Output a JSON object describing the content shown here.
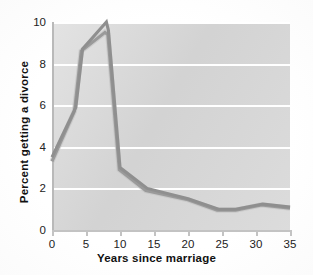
{
  "chart_data": {
    "type": "line",
    "title": "",
    "xlabel": "Years since marriage",
    "ylabel": "Percent getting a divorce",
    "xlim": [
      0,
      35
    ],
    "ylim": [
      0,
      10
    ],
    "xticks": [
      0,
      5,
      10,
      15,
      20,
      25,
      30,
      35
    ],
    "yticks": [
      0,
      2,
      4,
      6,
      8,
      10
    ],
    "grid": "horizontal",
    "legend": "none",
    "series": [
      {
        "name": "series-1",
        "color": "#8f8f8f",
        "x": [
          0,
          3.5,
          4.5,
          8,
          8.3,
          10,
          14,
          20,
          24.5,
          27,
          31,
          35
        ],
        "y": [
          3.5,
          5.9,
          8.7,
          10.0,
          9.6,
          3.0,
          2.0,
          1.5,
          1.0,
          1.0,
          1.25,
          1.1
        ]
      },
      {
        "name": "series-2",
        "color": "#9a9a9a",
        "x": [
          0,
          3.3,
          4.3,
          7.8,
          8.2,
          9.9,
          13.8,
          20,
          24.3,
          27,
          30.8,
          35
        ],
        "y": [
          3.3,
          5.7,
          8.6,
          9.5,
          9.4,
          2.9,
          1.9,
          1.45,
          0.95,
          0.95,
          1.2,
          1.05
        ]
      }
    ]
  },
  "axes": {
    "y_tick_labels": [
      "10",
      "8",
      "6",
      "4",
      "2",
      "0"
    ],
    "x_tick_labels": [
      "0",
      "5",
      "10",
      "15",
      "20",
      "25",
      "30",
      "35"
    ],
    "x_axis_title": "Years since marriage",
    "y_axis_title": "Percent getting a divorce"
  },
  "colors": {
    "plot_background": "#d7d7d7",
    "gridline": "#ffffff",
    "line_primary": "#8f8f8f",
    "line_secondary": "#9a9a9a",
    "page_background": "#ffffff",
    "text": "#1d1d1d"
  }
}
